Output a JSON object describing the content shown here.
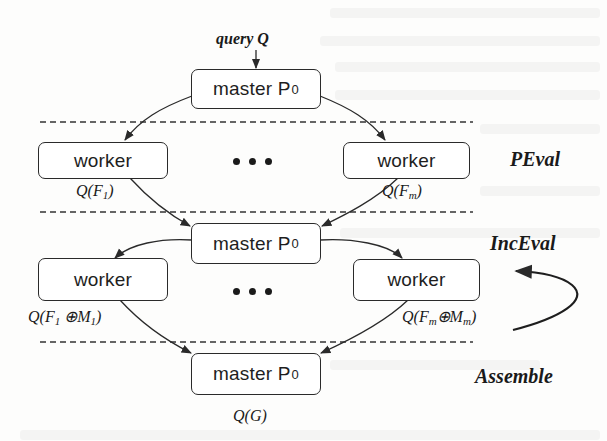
{
  "diagram": {
    "input_label": "query Q",
    "nodes": {
      "master_top": {
        "label": "master P",
        "subscript": "0"
      },
      "worker_pe_left": {
        "label": "worker"
      },
      "worker_pe_right": {
        "label": "worker"
      },
      "master_mid": {
        "label": "master P",
        "subscript": "0"
      },
      "worker_inc_left": {
        "label": "worker"
      },
      "worker_inc_right": {
        "label": "worker"
      },
      "master_bottom": {
        "label": "master P",
        "subscript": "0"
      }
    },
    "edge_labels": {
      "pe_left": {
        "prefix": "Q(F",
        "sub": "1",
        "suffix": ")"
      },
      "pe_right": {
        "prefix": "Q(F",
        "sub": "m",
        "suffix": ")"
      },
      "inc_left": {
        "prefix": "Q(F",
        "sub": "1",
        "mid": " ⊕M",
        "sub2": "1",
        "suffix": ")"
      },
      "inc_right": {
        "prefix": "Q(F",
        "sub": "m",
        "mid": "⊕M",
        "sub2": "m",
        "suffix": ")"
      },
      "output": "Q(G)"
    },
    "stages": {
      "peval": "PEval",
      "inceval": "IncEval",
      "assemble": "Assemble"
    },
    "ellipsis": "• • •",
    "colors": {
      "stroke": "#2a2a2a",
      "text": "#1a1a1a",
      "background": "#fdfdfc"
    }
  }
}
